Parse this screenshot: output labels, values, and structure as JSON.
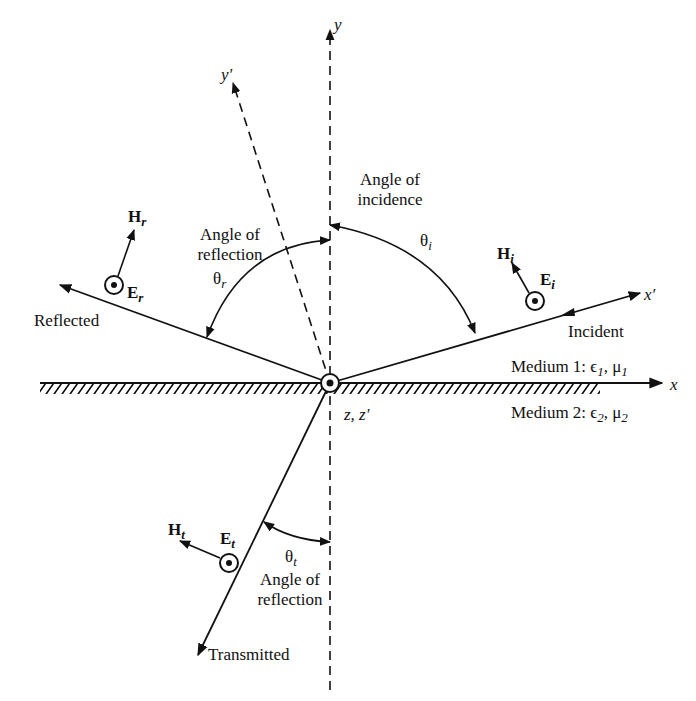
{
  "axes": {
    "y": "y",
    "y_prime": "y′",
    "x": "x",
    "x_prime": "x′",
    "z": "z, z′"
  },
  "rays": {
    "incident": "Incident",
    "reflected": "Reflected",
    "transmitted": "Transmitted"
  },
  "angles": {
    "incidence_line1": "Angle of",
    "incidence_line2": "incidence",
    "incidence_symbol": "θ",
    "incidence_sub": "i",
    "reflection_line1": "Angle of",
    "reflection_line2": "reflection",
    "reflection_symbol": "θ",
    "reflection_sub": "r",
    "transmission_line1": "Angle of",
    "transmission_line2": "reflection",
    "transmission_symbol": "θ",
    "transmission_sub": "t"
  },
  "fields": {
    "Hi": "H",
    "Hi_sub": "i",
    "Ei": "E",
    "Ei_sub": "i",
    "Hr": "H",
    "Hr_sub": "r",
    "Er": "E",
    "Er_sub": "r",
    "Ht": "H",
    "Ht_sub": "t",
    "Et": "E",
    "Et_sub": "t"
  },
  "media": {
    "medium1": "Medium 1: ϵ",
    "medium1_sub1": "1",
    "medium1_mu": ", μ",
    "medium1_sub2": "1",
    "medium2": "Medium 2: ϵ",
    "medium2_sub1": "2",
    "medium2_mu": ", μ",
    "medium2_sub2": "2"
  }
}
